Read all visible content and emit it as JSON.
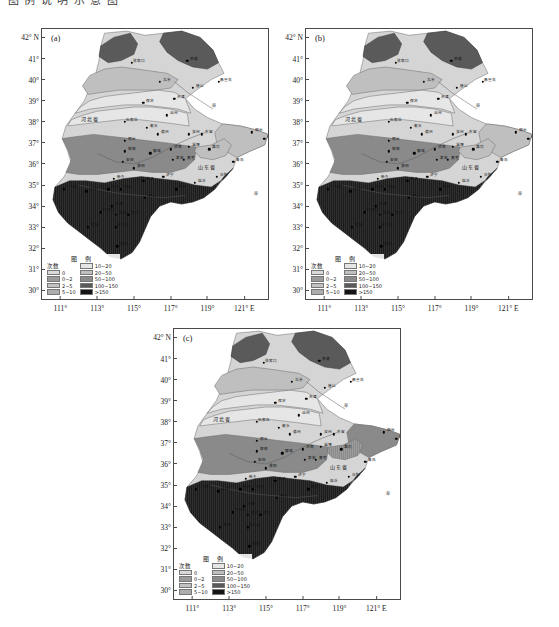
{
  "page": {
    "cropped_header_text": "图 例 说 明 示 意 图",
    "background": "#ffffff"
  },
  "panels": [
    {
      "id": "a",
      "label": "(a)",
      "frame": {
        "left": 41,
        "top": 28,
        "width": 228,
        "height": 272
      }
    },
    {
      "id": "b",
      "label": "(b)",
      "frame": {
        "left": 305,
        "top": 28,
        "width": 228,
        "height": 272
      }
    },
    {
      "id": "c",
      "label": "(c)",
      "frame": {
        "left": 173,
        "top": 328,
        "width": 228,
        "height": 272
      }
    }
  ],
  "axes": {
    "y_label_suffix": "° N",
    "y_ticks": [
      "42",
      "41",
      "40",
      "39",
      "38",
      "37",
      "36",
      "35",
      "34",
      "33",
      "32",
      "31",
      "30"
    ],
    "y_tick_labels": [
      "42° N",
      "41°",
      "40°",
      "39°",
      "38°",
      "37°",
      "36°",
      "35°",
      "34°",
      "33°",
      "32°",
      "31°",
      "30°"
    ],
    "x_tick_labels": [
      "111°",
      "113°",
      "115°",
      "117°",
      "119°",
      "121° E"
    ],
    "x_values": [
      111,
      113,
      115,
      117,
      119,
      121
    ],
    "y_range": [
      29.5,
      42.4
    ],
    "x_range": [
      110.0,
      122.4
    ]
  },
  "legend": {
    "title": "图 例",
    "count_header": "次数",
    "left_column": [
      {
        "label": "0",
        "color": "#d9d9d9"
      },
      {
        "label": "0~2",
        "color": "#9a9a9a"
      },
      {
        "label": "2~5",
        "color": "#c2c2c2"
      },
      {
        "label": "5~10",
        "color": "#adadad"
      }
    ],
    "right_column": [
      {
        "label": "10~20",
        "color": "#e6e6e6"
      },
      {
        "label": "20~50",
        "color": "#bfbfbf"
      },
      {
        "label": "50~100",
        "color": "#8a8a8a"
      },
      {
        "label": "100~150",
        "color": "#5a5a5a"
      },
      {
        "label": ">150",
        "color": "#151515"
      }
    ]
  },
  "map_text": {
    "provinces": [
      "河北省",
      "山东省",
      "河南省"
    ],
    "sea": [
      "海",
      "渤海"
    ],
    "station_labels": [
      "张家口",
      "承德",
      "北京",
      "天津",
      "唐山",
      "秦皇岛",
      "保定",
      "沧州",
      "石家庄",
      "衡水",
      "邢台",
      "邯郸",
      "德州",
      "滨州",
      "东营",
      "烟台",
      "威海",
      "青岛",
      "潍坊",
      "淄博",
      "济南",
      "泰安",
      "莱芜",
      "日照",
      "临沂",
      "枣庄",
      "济宁",
      "菏泽",
      "聊城",
      "安阳",
      "濮阳",
      "新乡",
      "郑州",
      "开封",
      "商丘",
      "周口",
      "许昌",
      "漯河",
      "平顶山",
      "洛阳",
      "三门峡",
      "南阳",
      "驻马店",
      "信阳"
    ]
  },
  "chart_data": {
    "type": "map",
    "panel_count": 3,
    "panel_ids": [
      "a",
      "b",
      "c"
    ],
    "classes": [
      "0",
      "0~2",
      "2~5",
      "5~10",
      "10~20",
      "20~50",
      "50~100",
      "100~150",
      ">150"
    ],
    "class_colors": [
      "#d9d9d9",
      "#9a9a9a",
      "#c2c2c2",
      "#adadad",
      "#e6e6e6",
      "#bfbfbf",
      "#8a8a8a",
      "#5a5a5a",
      "#151515"
    ],
    "xlabel": "Longitude (° E)",
    "ylabel": "Latitude (° N)",
    "xlim": [
      110.0,
      122.4
    ],
    "ylim": [
      29.5,
      42.4
    ],
    "grid": false,
    "legend_position": "bottom-left-inside",
    "panels": [
      {
        "id": "a",
        "label": "(a)",
        "regions": [
          {
            "name": "north-mountain",
            "class": "100~150",
            "color": "#5a5a5a"
          },
          {
            "name": "northwest-plateau",
            "class": "20~50",
            "color": "#bfbfbf"
          },
          {
            "name": "hebei-plain",
            "class": "10~20",
            "color": "#e6e6e6"
          },
          {
            "name": "central-belt",
            "class": "50~100",
            "color": "#8a8a8a"
          },
          {
            "name": "shandong-east",
            "class": "20~50",
            "color": "#bfbfbf"
          },
          {
            "name": "south-henan",
            "class": ">150",
            "color": "#151515"
          }
        ]
      },
      {
        "id": "b",
        "label": "(b)",
        "regions": [
          {
            "name": "north-mountain",
            "class": "100~150",
            "color": "#5a5a5a"
          },
          {
            "name": "northwest-plateau",
            "class": "20~50",
            "color": "#bfbfbf"
          },
          {
            "name": "hebei-plain",
            "class": "10~20",
            "color": "#e6e6e6"
          },
          {
            "name": "central-belt",
            "class": "50~100",
            "color": "#8a8a8a"
          },
          {
            "name": "shandong-east",
            "class": "20~50",
            "color": "#bfbfbf"
          },
          {
            "name": "south-henan",
            "class": ">150",
            "color": "#151515"
          }
        ]
      },
      {
        "id": "c",
        "label": "(c)",
        "regions": [
          {
            "name": "north-mountain",
            "class": "100~150",
            "color": "#5a5a5a"
          },
          {
            "name": "northwest-plateau",
            "class": "20~50",
            "color": "#bfbfbf"
          },
          {
            "name": "hebei-plain",
            "class": "10~20",
            "color": "#e6e6e6"
          },
          {
            "name": "central-belt",
            "class": "50~100",
            "color": "#8a8a8a"
          },
          {
            "name": "shandong-east",
            "class": "50~100",
            "color": "#8a8a8a"
          },
          {
            "name": "south-henan",
            "class": ">150",
            "color": "#151515"
          }
        ]
      }
    ]
  }
}
